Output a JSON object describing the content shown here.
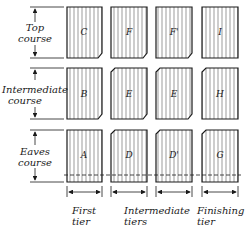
{
  "rows": [
    {
      "label_line1": "Top",
      "label_line2": "course",
      "tiles": [
        "C",
        "F",
        "F'",
        "I"
      ]
    },
    {
      "label_line1": "Intermediate",
      "label_line2": "course",
      "tiles": [
        "B",
        "E",
        "E",
        "H"
      ]
    },
    {
      "label_line1": "Eaves",
      "label_line2": "course",
      "tiles": [
        "A",
        "D",
        "D'",
        "G"
      ]
    }
  ],
  "columns": [
    {
      "label_line1": "First",
      "label_line2": "tier"
    },
    {
      "label_line1": "Intermediate",
      "label_line2": "tiers"
    },
    {
      "label_line1": "Finishing",
      "label_line2": "tier"
    }
  ],
  "colors": {
    "ink": "#1a1a1a",
    "background": "#ffffff"
  }
}
